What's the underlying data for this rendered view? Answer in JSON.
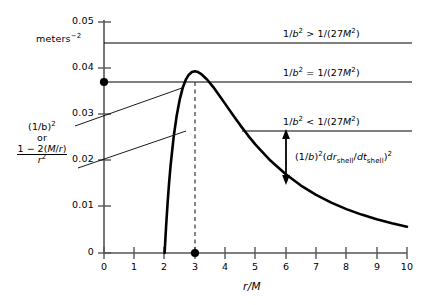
{
  "chart_data": {
    "type": "line",
    "title": "",
    "xlabel": "r/M",
    "ylabel": "",
    "yunit": "meters^-2",
    "xlim": [
      0,
      10
    ],
    "ylim": [
      0,
      0.05
    ],
    "grid": false,
    "x_ticks": [
      "0",
      "1",
      "2",
      "3",
      "4",
      "5",
      "6",
      "7",
      "8",
      "9",
      "10"
    ],
    "y_ticks": [
      "0",
      "0.01",
      "0.02",
      "0.03",
      "0.04",
      "0.05"
    ],
    "series": [
      {
        "name": "(1-2M/r)/r^2",
        "comment": "effective potential curve, x = r/M, y = meters^-2",
        "x": [
          2.0,
          2.05,
          2.1,
          2.15,
          2.2,
          2.3,
          2.4,
          2.5,
          2.6,
          2.7,
          2.8,
          2.9,
          3.0,
          3.1,
          3.2,
          3.4,
          3.6,
          3.8,
          4.0,
          4.25,
          4.5,
          4.75,
          5.0,
          5.5,
          6.0,
          6.5,
          7.0,
          7.5,
          8.0,
          8.5,
          9.0,
          9.5,
          10.0
        ],
        "y": [
          0.0,
          0.0058,
          0.0108,
          0.01514,
          0.0189,
          0.02496,
          0.02951,
          0.03296,
          0.0355,
          0.03719,
          0.03827,
          0.03885,
          0.03899,
          0.03884,
          0.03845,
          0.03724,
          0.03566,
          0.03387,
          0.032,
          0.02966,
          0.02739,
          0.02525,
          0.02326,
          0.01979,
          0.01689,
          0.01448,
          0.01248,
          0.01081,
          0.00942,
          0.00824,
          0.00723,
          0.00637,
          0.00564
        ]
      }
    ],
    "reference_lines": [
      {
        "id": "line-above",
        "y": 0.0455,
        "label": "1/b² > 1/(27M²)",
        "x_start": 0.0,
        "x_end": 10.0
      },
      {
        "id": "line-critical",
        "y": 0.037,
        "label": "1/b² = 1/(27M²)",
        "x_start": 0.0,
        "x_end": 10.0
      },
      {
        "id": "line-below",
        "y": 0.0265,
        "label": "1/b² < 1/(27M²)",
        "x_start": 4.55,
        "x_end": 10.0
      }
    ],
    "markers": [
      {
        "id": "marker-axis-critical",
        "x": 0.0,
        "y": 0.037
      },
      {
        "id": "marker-photon-sphere",
        "x": 3.0,
        "y": 0.0
      }
    ],
    "dashed_vertical": {
      "x": 3.0,
      "y_from": 0.0,
      "y_to": 0.037
    },
    "annotations": [
      {
        "id": "arrow-gap",
        "x": 6.5,
        "y_top": 0.0265,
        "y_bottom": 0.0165,
        "label": "(1/b)²(dr_shell/dt_shell)²"
      }
    ]
  },
  "axes": {
    "y_unit_label": "meters",
    "y_unit_exponent": "−2",
    "x_title_numerator": "r",
    "x_title_slash": "/",
    "x_title_denominator": "M",
    "y_tick_labels": [
      "0.05",
      "0.04",
      "0.03",
      "0.02",
      "0.01",
      "0"
    ],
    "x_tick_labels": [
      "0",
      "1",
      "2",
      "3",
      "4",
      "5",
      "6",
      "7",
      "8",
      "9",
      "10"
    ]
  },
  "left_label": {
    "line1_base": "(1/b)",
    "line1_exp": "2",
    "line2": "or",
    "frac_num_a": "1 − 2(",
    "frac_num_b": "M",
    "frac_num_c": "/",
    "frac_num_d": "r",
    "frac_num_e": ")",
    "frac_den_base": "r",
    "frac_den_exp": "2"
  },
  "annotations": {
    "above": {
      "a": "1/",
      "b": "b",
      "b_exp": "2",
      "rel": " > ",
      "c": "1/(27",
      "m": "M",
      "m_exp": "2",
      "close": ")"
    },
    "critical": {
      "a": "1/",
      "b": "b",
      "b_exp": "2",
      "rel": " = ",
      "c": "1/(27",
      "m": "M",
      "m_exp": "2",
      "close": ")"
    },
    "below": {
      "a": "1/",
      "b": "b",
      "b_exp": "2",
      "rel": " < ",
      "c": "1/(27",
      "m": "M",
      "m_exp": "2",
      "close": ")"
    },
    "gap": {
      "p1": "(1/",
      "b": "b",
      "p2": ")",
      "exp1": "2",
      "p3": "(",
      "dr": "dr",
      "sub1": "shell",
      "slash": "/",
      "dt": "dt",
      "sub2": "shell",
      "p4": ")",
      "exp2": "2"
    }
  },
  "colors": {
    "curve": "#000000",
    "axis": "#555555",
    "reference_line": "#000000",
    "background": "#ffffff"
  }
}
